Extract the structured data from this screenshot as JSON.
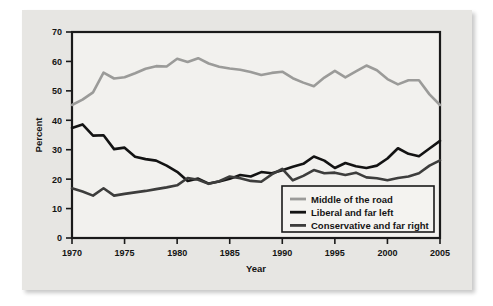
{
  "figure": {
    "panel_bg": "#e7e6e3",
    "plot_bg": "#f2f1ee",
    "axis_color": "#1a1a1a"
  },
  "chart_data": {
    "type": "line",
    "title": "",
    "xlabel": "Year",
    "ylabel": "Percent",
    "xlim": [
      1970,
      2005
    ],
    "ylim": [
      0,
      70
    ],
    "xticks": [
      1970,
      1975,
      1980,
      1985,
      1990,
      1995,
      2000,
      2005
    ],
    "yticks": [
      0,
      10,
      20,
      30,
      40,
      50,
      60,
      70
    ],
    "xtick_labels": [
      "1970",
      "1975",
      "1980",
      "1985",
      "1990",
      "1995",
      "2000",
      "2005"
    ],
    "ytick_labels": [
      "0",
      "10",
      "20",
      "30",
      "40",
      "50",
      "60",
      "70"
    ],
    "grid": false,
    "legend_position": "lower right",
    "x": [
      1970,
      1971,
      1972,
      1973,
      1974,
      1975,
      1976,
      1977,
      1978,
      1979,
      1980,
      1981,
      1982,
      1983,
      1984,
      1985,
      1986,
      1987,
      1988,
      1989,
      1990,
      1991,
      1992,
      1993,
      1994,
      1995,
      1996,
      1997,
      1998,
      1999,
      2000,
      2001,
      2002,
      2003,
      2004,
      2005
    ],
    "series": [
      {
        "name": "Middle of the road",
        "color": "#9b9b99",
        "width": 2.6,
        "values": [
          45.2,
          47.0,
          49.5,
          56.2,
          54.2,
          54.6,
          56.0,
          57.5,
          58.4,
          58.3,
          60.9,
          59.8,
          61.1,
          59.3,
          58.2,
          57.6,
          57.2,
          56.4,
          55.4,
          56.1,
          56.5,
          54.3,
          52.8,
          51.6,
          54.5,
          56.8,
          54.6,
          56.6,
          58.6,
          57.0,
          54.0,
          52.2,
          53.6,
          53.6,
          48.8,
          45.2
        ]
      },
      {
        "name": "Liberal and far left",
        "color": "#131313",
        "width": 2.6,
        "values": [
          37.4,
          38.6,
          34.8,
          34.9,
          30.2,
          30.7,
          27.6,
          26.8,
          26.3,
          24.6,
          22.5,
          19.4,
          20.2,
          18.5,
          19.2,
          20.1,
          21.4,
          20.9,
          22.4,
          22.0,
          23.0,
          24.2,
          25.2,
          27.7,
          26.3,
          23.8,
          25.5,
          24.4,
          23.8,
          24.6,
          27.0,
          30.5,
          28.6,
          27.8,
          30.4,
          33.0
        ]
      },
      {
        "name": "Conservative and far right",
        "color": "#3d3d3c",
        "width": 2.6,
        "values": [
          16.9,
          15.8,
          14.4,
          16.9,
          14.4,
          15.0,
          15.5,
          16.0,
          16.6,
          17.2,
          17.9,
          20.4,
          19.8,
          18.4,
          19.3,
          20.9,
          20.3,
          19.4,
          19.1,
          21.6,
          23.5,
          19.6,
          21.1,
          23.1,
          22.0,
          22.2,
          21.4,
          22.2,
          20.6,
          20.3,
          19.6,
          20.4,
          20.9,
          22.0,
          24.6,
          26.4
        ]
      }
    ],
    "legend": [
      {
        "label": "Middle of the road",
        "color": "#9b9b99"
      },
      {
        "label": "Liberal and far left",
        "color": "#131313"
      },
      {
        "label": "Conservative and far right",
        "color": "#3d3d3c"
      }
    ]
  }
}
